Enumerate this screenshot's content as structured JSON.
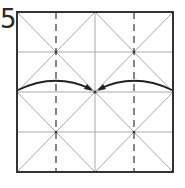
{
  "step": {
    "number": "5"
  },
  "diagram": {
    "colors": {
      "border": "#333333",
      "crease": "#a8a8a8",
      "dashed": "#444444",
      "arrow": "#222222",
      "background": "#ffffff"
    },
    "square": {
      "x": 17,
      "y": 12,
      "size": 156
    }
  }
}
